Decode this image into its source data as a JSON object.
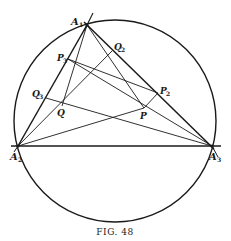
{
  "figure": {
    "caption": "Fig. 48",
    "caption_display": "FIG. 48",
    "stroke_color": "#1a1a1a",
    "background": "#ffffff"
  },
  "circle": {
    "cx": 115,
    "cy": 121,
    "r": 101
  },
  "points": {
    "A1": {
      "x": 87,
      "y": 25,
      "label": "A",
      "sub": "1"
    },
    "A2": {
      "x": 18,
      "y": 146,
      "label": "A",
      "sub": "2"
    },
    "A3": {
      "x": 212,
      "y": 146,
      "label": "A",
      "sub": "3"
    },
    "P": {
      "x": 144,
      "y": 108,
      "label": "P",
      "sub": ""
    },
    "P2": {
      "x": 158,
      "y": 93,
      "label": "P",
      "sub": "2"
    },
    "P3": {
      "x": 68,
      "y": 59,
      "label": "P",
      "sub": "3"
    },
    "Q": {
      "x": 62,
      "y": 106,
      "label": "Q",
      "sub": ""
    },
    "Q2": {
      "x": 112,
      "y": 51,
      "label": "Q",
      "sub": "2"
    },
    "Q3": {
      "x": 46,
      "y": 98,
      "label": "Q",
      "sub": "3"
    }
  },
  "labels": {
    "A1": "A",
    "A1_sub": "1",
    "A2": "A",
    "A2_sub": "2",
    "A3": "A",
    "A3_sub": "3",
    "P": "P",
    "P2": "P",
    "P2_sub": "2",
    "P3": "P",
    "P3_sub": "3",
    "Q": "Q",
    "Q2": "Q",
    "Q2_sub": "2",
    "Q3": "Q",
    "Q3_sub": "3"
  },
  "segments": [
    "A1-A2",
    "A1-A3",
    "A2-A3",
    "tangent-at-A1",
    "A1-Q",
    "A1-P",
    "A2-Q2",
    "A2-P",
    "A3-P3",
    "A3-Q3",
    "P3-P2",
    "P-P2",
    "Q3-Q",
    "Q-Q2"
  ]
}
